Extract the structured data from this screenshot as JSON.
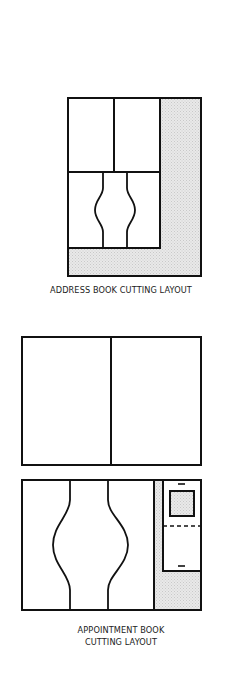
{
  "figures": [
    {
      "id": "address-book",
      "caption": "ADDRESS BOOK CUTTING LAYOUT"
    },
    {
      "id": "appointment-book",
      "caption_line1": "APPOINTMENT BOOK",
      "caption_line2": "CUTTING LAYOUT"
    }
  ],
  "colors": {
    "line": "#111111",
    "shade": "#e4e4e4",
    "background": "#ffffff"
  }
}
